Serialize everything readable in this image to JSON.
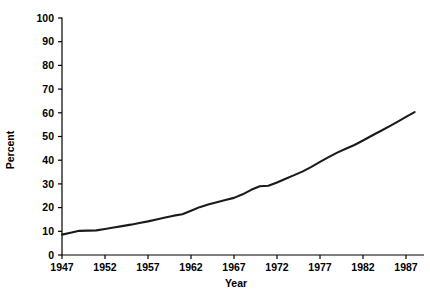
{
  "chart_data": {
    "type": "line",
    "title": "",
    "xlabel": "Year",
    "ylabel": "Percent",
    "xlim": [
      1947,
      1988
    ],
    "ylim": [
      0,
      100
    ],
    "grid": false,
    "legend": "none",
    "xticks": [
      1947,
      1952,
      1957,
      1962,
      1967,
      1972,
      1977,
      1982,
      1987
    ],
    "xtick_labels": [
      "1947",
      "1952",
      "1957",
      "1962",
      "1967",
      "1972",
      "1977",
      "1982",
      "1987"
    ],
    "yticks": [
      0,
      10,
      20,
      30,
      40,
      50,
      60,
      70,
      80,
      90,
      100
    ],
    "ytick_labels": [
      "0",
      "10",
      "20",
      "30",
      "40",
      "50",
      "60",
      "70",
      "80",
      "90",
      "100"
    ],
    "series": [
      {
        "name": "Percent",
        "color": "#1a1a1a",
        "x": [
          1947,
          1948,
          1949,
          1950,
          1951,
          1952,
          1953,
          1954,
          1955,
          1956,
          1957,
          1958,
          1959,
          1960,
          1961,
          1962,
          1963,
          1964,
          1965,
          1966,
          1967,
          1968,
          1969,
          1970,
          1971,
          1972,
          1973,
          1974,
          1975,
          1976,
          1977,
          1978,
          1979,
          1980,
          1981,
          1982,
          1983,
          1984,
          1985,
          1986,
          1987,
          1988
        ],
        "values": [
          8.6,
          9.4,
          10.2,
          10.3,
          10.4,
          11.0,
          11.6,
          12.2,
          12.8,
          13.5,
          14.2,
          15.0,
          15.8,
          16.6,
          17.2,
          18.7,
          20.2,
          21.3,
          22.3,
          23.2,
          24.1,
          25.6,
          27.5,
          29.0,
          29.2,
          30.6,
          32.2,
          33.7,
          35.3,
          37.2,
          39.3,
          41.3,
          43.2,
          44.8,
          46.4,
          48.3,
          50.3,
          52.2,
          54.2,
          56.2,
          58.3,
          60.3
        ]
      }
    ],
    "series_extended_note": ""
  },
  "axes": {
    "y_axis_title": "Percent",
    "x_axis_title": "Year"
  }
}
